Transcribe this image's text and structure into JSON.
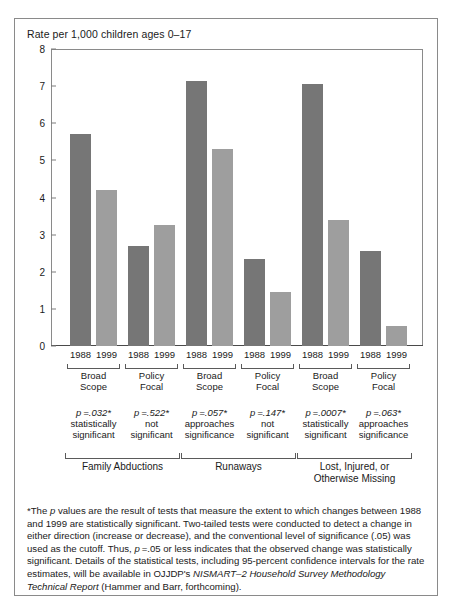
{
  "chart_data": {
    "type": "bar",
    "title": "Rate per 1,000 children ages 0–17",
    "ylabel": "Rate per 1,000 children ages 0–17",
    "xlabel": "",
    "ylim": [
      0,
      8
    ],
    "yticks": [
      0,
      1,
      2,
      3,
      4,
      5,
      6,
      7,
      8
    ],
    "grid": false,
    "legend": null,
    "categories": [
      "Family Abductions — Broad Scope",
      "Family Abductions — Policy Focal",
      "Runaways — Broad Scope",
      "Runaways — Policy Focal",
      "Lost, Injured, or Otherwise Missing — Broad Scope",
      "Lost, Injured, or Otherwise Missing — Policy Focal"
    ],
    "series": [
      {
        "name": "1988",
        "color": "#767676",
        "values": [
          5.7,
          2.7,
          7.15,
          2.35,
          7.05,
          2.55
        ]
      },
      {
        "name": "1999",
        "color": "#9e9e9e",
        "values": [
          4.2,
          3.25,
          5.3,
          1.45,
          3.4,
          0.55
        ]
      }
    ],
    "groups": [
      {
        "category": "Family Abductions",
        "scopes": [
          {
            "scope_line1": "Broad",
            "scope_line2": "Scope",
            "years": [
              "1988",
              "1999"
            ],
            "p_value": "p =.032*",
            "note_line1": "statistically",
            "note_line2": "significant"
          },
          {
            "scope_line1": "Policy",
            "scope_line2": "Focal",
            "years": [
              "1988",
              "1999"
            ],
            "p_value": "p =.522*",
            "note_line1": "not",
            "note_line2": "significant"
          }
        ]
      },
      {
        "category": "Runaways",
        "scopes": [
          {
            "scope_line1": "Broad",
            "scope_line2": "Scope",
            "years": [
              "1988",
              "1999"
            ],
            "p_value": "p =.057*",
            "note_line1": "approaches",
            "note_line2": "significance"
          },
          {
            "scope_line1": "Policy",
            "scope_line2": "Focal",
            "years": [
              "1988",
              "1999"
            ],
            "p_value": "p =.147*",
            "note_line1": "not",
            "note_line2": "significant"
          }
        ]
      },
      {
        "category": "Lost, Injured, or Otherwise Missing",
        "category_line1": "Lost, Injured, or",
        "category_line2": "Otherwise Missing",
        "scopes": [
          {
            "scope_line1": "Broad",
            "scope_line2": "Scope",
            "years": [
              "1988",
              "1999"
            ],
            "p_value": "p =.0007*",
            "note_line1": "statistically",
            "note_line2": "significant"
          },
          {
            "scope_line1": "Policy",
            "scope_line2": "Focal",
            "years": [
              "1988",
              "1999"
            ],
            "p_value": "p =.063*",
            "note_line1": "approaches",
            "note_line2": "significance"
          }
        ]
      }
    ],
    "annotations": {
      "footnote": "*The p values are the result of tests that measure the extent to which changes between 1988 and 1999 are statistically significant. Two-tailed tests were conducted to detect a change in either direction (increase or decrease), and the conventional level of significance (.05) was used as the cutoff. Thus, p =.05 or less indicates that the observed change was statistically significant. Details of the statistical tests, including 95-percent confidence intervals for the rate estimates, will be available in OJJDP's NISMART–2 Household Survey Methodology Technical Report (Hammer and Barr, forthcoming)."
    }
  },
  "footnote_parts": {
    "seg1": "*The ",
    "it1": "p",
    "seg2": " values are the result of tests that measure the extent to which changes between 1988 and 1999 are statistically significant. Two-tailed tests were conducted to detect a change in either direction (increase or decrease), and the conventional level of significance (.05) was used as the cutoff. Thus, ",
    "it2": "p",
    "seg3": " =.05 or less indicates that the observed change was statistically significant. Details of the statistical tests, including 95-percent confidence intervals for the rate estimates, will be available in OJJDP's ",
    "it3": "NISMART–2 Household Survey Methodology Technical Report",
    "seg4": " (Hammer and Barr, forthcoming)."
  },
  "colors": {
    "bar_1988": "#767676",
    "bar_1999": "#9e9e9e",
    "frame": "#8a8a8a",
    "text": "#1a1a1a"
  }
}
